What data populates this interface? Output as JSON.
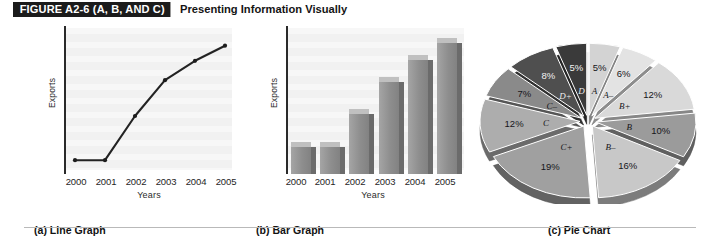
{
  "header": {
    "figure_tag": "FIGURE A2-6 (A, B, AND C)",
    "caption": "Presenting Information Visually"
  },
  "panels": {
    "line": {
      "caption": "(a) Line Graph",
      "ylabel": "Exports",
      "xlabel": "Years"
    },
    "bar": {
      "caption": "(b) Bar Graph",
      "ylabel": "Exports",
      "xlabel": "Years"
    },
    "pie": {
      "caption": "(c) Pie Chart"
    }
  },
  "footer": {
    "rule": true
  },
  "chart_data": [
    {
      "type": "line",
      "title": "(a) Line Graph",
      "xlabel": "Years",
      "ylabel": "Exports",
      "categories": [
        "2000",
        "2001",
        "2002",
        "2003",
        "2004",
        "2005"
      ],
      "values": [
        10,
        10,
        42,
        68,
        82,
        93
      ],
      "ylim": [
        0,
        100
      ],
      "grid": true,
      "legend": "none",
      "marker": "dot",
      "series": [
        {
          "name": "Exports",
          "values": [
            10,
            10,
            42,
            68,
            82,
            93
          ]
        }
      ]
    },
    {
      "type": "bar",
      "title": "(b) Bar Graph",
      "xlabel": "Years",
      "ylabel": "Exports",
      "categories": [
        "2000",
        "2001",
        "2002",
        "2003",
        "2004",
        "2005"
      ],
      "values": [
        19,
        19,
        42,
        65,
        80,
        92
      ],
      "ylim": [
        0,
        100
      ],
      "grid": true,
      "legend": "none",
      "style": "3d-column"
    },
    {
      "type": "pie",
      "title": "(c) Pie Chart",
      "legend": "none",
      "exploded": true,
      "labels": [
        "A",
        "A–",
        "B+",
        "B",
        "B–",
        "C+",
        "C",
        "C–",
        "D+",
        "D"
      ],
      "values": [
        5,
        6,
        12,
        10,
        16,
        19,
        12,
        7,
        8,
        5
      ],
      "value_labels": [
        "5%",
        "6%",
        "12%",
        "10%",
        "16%",
        "19%",
        "12%",
        "7%",
        "8%",
        "5%"
      ],
      "colors": [
        "#d3d3d3",
        "#e3e3e3",
        "#d9d9d9",
        "#9b9b9b",
        "#c8c8c8",
        "#a0a0a0",
        "#adadad",
        "#8a8a8a",
        "#4f4f4f",
        "#3a3a3a"
      ],
      "total": 100
    }
  ]
}
